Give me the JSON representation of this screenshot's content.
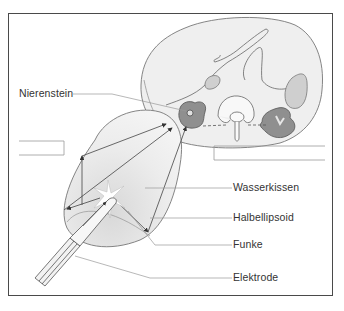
{
  "labels": {
    "nierenstein": "Nierenstein",
    "wasserkissen": "Wasserkissen",
    "halbellipsoid": "Halbellipsoid",
    "funke": "Funke",
    "elektrode": "Elektrode"
  },
  "colors": {
    "frame": "#4a4a4a",
    "body_fill": "#efefef",
    "body_stroke": "#777777",
    "kidney_fill": "#8f8f8f",
    "organ_fill": "#cfcfcf",
    "cushion_fill": "#e6e6e6",
    "line": "#444444",
    "leader": "#9a9a9a",
    "text": "#333333"
  }
}
